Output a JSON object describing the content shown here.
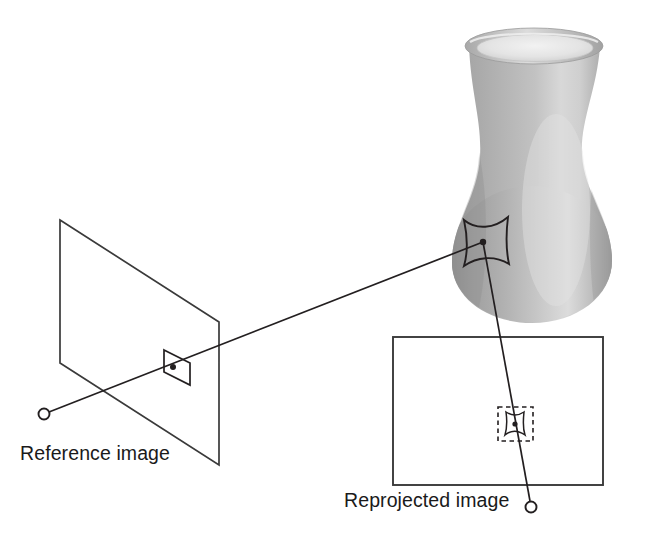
{
  "figure": {
    "width": 656,
    "height": 540,
    "background": "#ffffff",
    "line_color": "#231f20",
    "title": ""
  },
  "labels": {
    "reference_image": "Reference image",
    "reprojected_image": "Reprojected image"
  },
  "scene": {
    "object": {
      "name": "vase",
      "description": "shaded grey ceramic vase",
      "fill_light": "#e9e9e9",
      "fill_mid": "#b4b4b4",
      "fill_dark": "#8f8f8f",
      "rim_top_y": 30,
      "bottom_y": 322,
      "left_x": 452,
      "right_x": 612
    },
    "surface_patch": {
      "name": "surface-patch",
      "center_x": 483,
      "center_y": 242
    },
    "reference_plane": {
      "corners": "60,220 219,322 219,465 60,363",
      "patch_center_x": 173,
      "patch_center_y": 367
    },
    "reprojected_plane": {
      "x": 393,
      "y": 337,
      "width": 210,
      "height": 148,
      "dashed_box": {
        "x": 498,
        "y": 407,
        "width": 35,
        "height": 34
      },
      "patch_center_x": 515,
      "patch_center_y": 424
    },
    "camera_left": {
      "center_x": 44,
      "center_y": 414,
      "radius": 5.5
    },
    "camera_right": {
      "center_x": 531,
      "center_y": 507,
      "radius": 5.5
    },
    "rays": [
      {
        "name": "ray-reference-to-surface",
        "from": "camera_left",
        "to": "surface_patch"
      },
      {
        "name": "ray-surface-to-reprojected",
        "from": "surface_patch",
        "to": "camera_right"
      }
    ]
  }
}
